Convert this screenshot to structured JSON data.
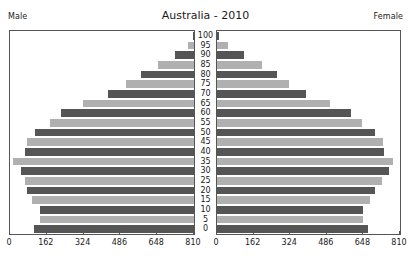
{
  "chart_data": {
    "type": "bar",
    "title": "Australia - 2010",
    "subtitle": "",
    "xlabel": "",
    "ylabel": "",
    "orientation": "horizontal-diverging",
    "left_series_label": "Male",
    "right_series_label": "Female",
    "categories": [
      "0",
      "5",
      "10",
      "15",
      "20",
      "25",
      "30",
      "35",
      "40",
      "45",
      "50",
      "55",
      "60",
      "65",
      "70",
      "75",
      "80",
      "85",
      "90",
      "95",
      "100"
    ],
    "xticks": [
      0,
      162,
      324,
      486,
      648,
      810
    ],
    "xlim": [
      0,
      810
    ],
    "left_xticklabels": [
      "810",
      "648",
      "486",
      "324",
      "162",
      "0"
    ],
    "right_xticklabels": [
      "0",
      "162",
      "324",
      "486",
      "648",
      "810"
    ],
    "grid": false,
    "legend": "none",
    "bar_colors": {
      "dark": "#555555",
      "light": "#b0b0b0"
    },
    "series": [
      {
        "name": "Male",
        "values": [
          705,
          680,
          680,
          715,
          735,
          745,
          760,
          795,
          745,
          735,
          700,
          635,
          585,
          490,
          380,
          300,
          235,
          160,
          85,
          28,
          5
        ]
      },
      {
        "name": "Female",
        "values": [
          668,
          645,
          648,
          678,
          700,
          730,
          760,
          780,
          740,
          735,
          700,
          640,
          592,
          500,
          395,
          320,
          265,
          200,
          120,
          48,
          10
        ]
      }
    ]
  },
  "labels": {
    "male": "Male",
    "female": "Female",
    "title": "Australia - 2010"
  }
}
